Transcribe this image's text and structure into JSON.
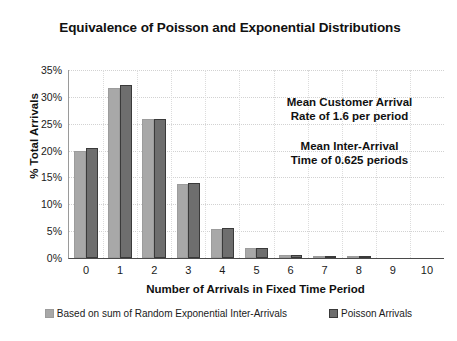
{
  "chart_data": {
    "type": "bar",
    "title": "Equivalence of Poisson and Exponential Distributions",
    "xlabel": "Number of Arrivals in Fixed Time Period",
    "ylabel": "% Total Arrivals",
    "categories": [
      "0",
      "1",
      "2",
      "3",
      "4",
      "5",
      "6",
      "7",
      "8",
      "9",
      "10"
    ],
    "series": [
      {
        "name": "Based on sum of Random Exponential Inter-Arrivals",
        "color": "#a8a8a8",
        "values": [
          20.0,
          31.7,
          25.8,
          13.8,
          5.4,
          1.8,
          0.6,
          0.2,
          0.1,
          0.0,
          0.0
        ]
      },
      {
        "name": "Poisson Arrivals",
        "color": "#6e6e6e",
        "values": [
          20.5,
          32.3,
          25.8,
          14.0,
          5.6,
          1.8,
          0.6,
          0.2,
          0.05,
          0.0,
          0.0
        ]
      }
    ],
    "ylim": [
      0,
      35
    ],
    "y_ticks": [
      "0%",
      "5%",
      "10%",
      "15%",
      "20%",
      "25%",
      "30%",
      "35%"
    ],
    "y_tick_values": [
      0,
      5,
      10,
      15,
      20,
      25,
      30,
      35
    ],
    "grid": "horizontal-dotted-and-vertical-dotted",
    "legend_position": "bottom",
    "annotations": [
      "Mean Customer Arrival\nRate of 1.6 per period",
      "Mean Inter-Arrival\nTime of 0.625 periods"
    ]
  }
}
